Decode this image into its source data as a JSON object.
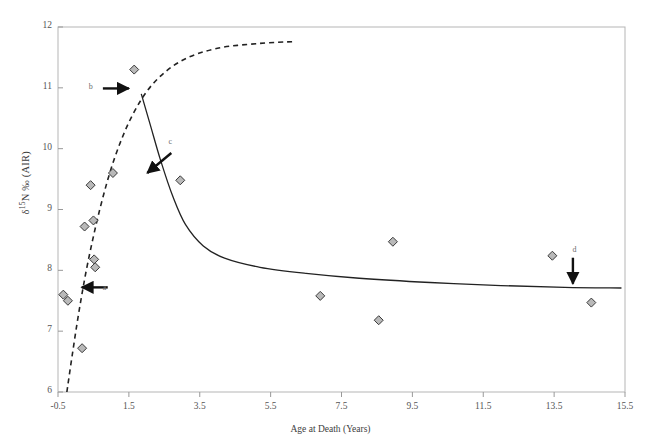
{
  "chart_data": {
    "type": "scatter",
    "title": "",
    "xlabel": "Age at Death (Years)",
    "ylabel": "δ¹⁵N ‰ (AIR)",
    "ylabel_parts": {
      "delta": "δ",
      "superscript": "15",
      "element": "N",
      "permil": "‰",
      "standard": "(AIR)"
    },
    "xlim": [
      -0.5,
      15.5
    ],
    "ylim": [
      6,
      12
    ],
    "xticks": [
      -0.5,
      1.5,
      3.5,
      5.5,
      7.5,
      9.5,
      11.5,
      13.5,
      15.5
    ],
    "xtick_labels": [
      "-0.5",
      "1.5",
      "3.5",
      "5.5",
      "7.5",
      "9.5",
      "11.5",
      "13.5",
      "15.5"
    ],
    "yticks": [
      6,
      7,
      8,
      9,
      10,
      11,
      12
    ],
    "ytick_labels": [
      "6",
      "7",
      "8",
      "9",
      "10",
      "11",
      "12"
    ],
    "grid": false,
    "legend": "none",
    "marker": {
      "shape": "diamond",
      "fill": "#b9b9b9",
      "stroke": "#3a3a3a",
      "size_px": 9
    },
    "points": [
      {
        "x": -0.35,
        "y": 7.6
      },
      {
        "x": -0.22,
        "y": 7.5
      },
      {
        "x": 0.18,
        "y": 6.72
      },
      {
        "x": 0.25,
        "y": 8.72
      },
      {
        "x": 0.42,
        "y": 9.4
      },
      {
        "x": 0.5,
        "y": 8.82
      },
      {
        "x": 0.52,
        "y": 8.18
      },
      {
        "x": 0.55,
        "y": 8.05
      },
      {
        "x": 1.05,
        "y": 9.6
      },
      {
        "x": 1.65,
        "y": 11.3
      },
      {
        "x": 2.95,
        "y": 9.48
      },
      {
        "x": 6.9,
        "y": 7.58
      },
      {
        "x": 8.55,
        "y": 7.18
      },
      {
        "x": 8.95,
        "y": 8.47
      },
      {
        "x": 13.45,
        "y": 8.24
      },
      {
        "x": 14.55,
        "y": 7.47
      }
    ],
    "series": [
      {
        "name": "breastfeeding-enrichment-curve",
        "style": "dashed",
        "color": "#222222",
        "points": [
          {
            "x": -0.25,
            "y": 6.0
          },
          {
            "x": -0.1,
            "y": 6.6
          },
          {
            "x": 0.1,
            "y": 7.35
          },
          {
            "x": 0.35,
            "y": 8.15
          },
          {
            "x": 0.7,
            "y": 9.05
          },
          {
            "x": 1.1,
            "y": 9.85
          },
          {
            "x": 1.6,
            "y": 10.55
          },
          {
            "x": 2.2,
            "y": 11.08
          },
          {
            "x": 3.0,
            "y": 11.45
          },
          {
            "x": 4.0,
            "y": 11.65
          },
          {
            "x": 5.2,
            "y": 11.73
          },
          {
            "x": 6.15,
            "y": 11.76
          }
        ]
      },
      {
        "name": "weaning-decline-curve",
        "style": "solid",
        "color": "#222222",
        "points": [
          {
            "x": 1.85,
            "y": 10.9
          },
          {
            "x": 2.1,
            "y": 10.4
          },
          {
            "x": 2.4,
            "y": 9.8
          },
          {
            "x": 2.75,
            "y": 9.2
          },
          {
            "x": 3.1,
            "y": 8.75
          },
          {
            "x": 3.6,
            "y": 8.4
          },
          {
            "x": 4.2,
            "y": 8.2
          },
          {
            "x": 5.2,
            "y": 8.05
          },
          {
            "x": 6.5,
            "y": 7.95
          },
          {
            "x": 8.0,
            "y": 7.87
          },
          {
            "x": 10.0,
            "y": 7.8
          },
          {
            "x": 12.0,
            "y": 7.75
          },
          {
            "x": 13.8,
            "y": 7.72
          },
          {
            "x": 15.4,
            "y": 7.71
          }
        ]
      }
    ],
    "annotations": [
      {
        "label": "a",
        "direction": "left",
        "target": "dashed-rise-lower",
        "label_x": 0.85,
        "label_y": 7.7,
        "tip_x": 0.17,
        "tip_y": 7.72
      },
      {
        "label": "b",
        "direction": "right",
        "target": "curve-junction",
        "label_x": 0.45,
        "label_y": 10.99,
        "tip_x": 1.5,
        "tip_y": 10.99
      },
      {
        "label": "c",
        "direction": "down-left",
        "target": "solid-decline",
        "label_x": 2.7,
        "label_y": 10.1,
        "tip_x": 2.02,
        "tip_y": 9.6
      },
      {
        "label": "d",
        "direction": "down",
        "target": "solid-plateau",
        "label_x": 14.1,
        "label_y": 8.32,
        "tip_x": 14.03,
        "tip_y": 7.78
      }
    ]
  }
}
